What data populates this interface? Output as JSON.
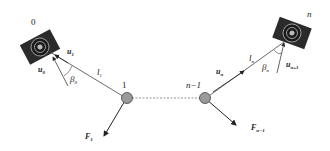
{
  "diagram": {
    "nodes": [
      {
        "id": "0",
        "label": "0",
        "type": "camera"
      },
      {
        "id": "1",
        "label": "1",
        "type": "joint"
      },
      {
        "id": "n-1",
        "label": "n−1",
        "type": "joint"
      },
      {
        "id": "n",
        "label": "n",
        "type": "camera"
      }
    ],
    "labels": {
      "node0": "0",
      "node1": "1",
      "nodeN1": "n−1",
      "nodeN": "n",
      "u1": "u",
      "u1_sub": "1",
      "u0": "u",
      "u0_sub": "0",
      "u0_sup": "*",
      "beta0": "β",
      "beta0_sub": "0",
      "beta0_sup": "*",
      "l1": "l",
      "l1_sub": "1",
      "F1": "F",
      "F1_sub": "1",
      "un": "u",
      "un_sub": "n",
      "ln": "l",
      "ln_sub": "n",
      "betan": "β",
      "betan_sub": "n",
      "betan_sup": "*",
      "un1": "u",
      "un1_sub": "n+1",
      "un1_sup": "*",
      "Fn1": "F",
      "Fn1_sub": "n−1",
      "Fn1_sup": "c"
    },
    "colors": {
      "camera_body": "#2b2b2b",
      "joint_fill": "#9a9a9a",
      "line": "#444444"
    }
  }
}
